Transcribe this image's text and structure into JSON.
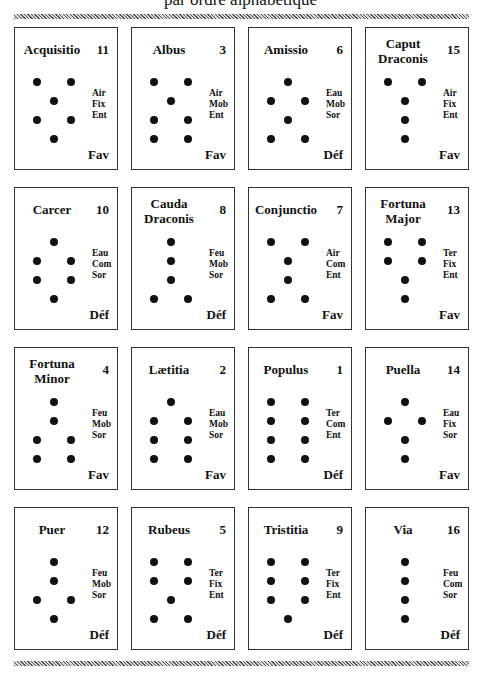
{
  "header": {
    "subtitle": "par ordre alphabétique"
  },
  "figures": [
    {
      "name": "Acquisitio",
      "number": "11",
      "attrs": [
        "Air",
        "Fix",
        "Ent"
      ],
      "status": "Fav",
      "rows": [
        "2",
        "1",
        "2",
        "1"
      ]
    },
    {
      "name": "Albus",
      "number": "3",
      "attrs": [
        "Air",
        "Mob",
        "Ent"
      ],
      "status": "Fav",
      "rows": [
        "2",
        "1",
        "2",
        "2"
      ]
    },
    {
      "name": "Amissio",
      "number": "6",
      "attrs": [
        "Eau",
        "Mob",
        "Sor"
      ],
      "status": "Déf",
      "rows": [
        "1",
        "2",
        "1",
        "2"
      ]
    },
    {
      "name": "Caput Draconis",
      "number": "15",
      "attrs": [
        "Air",
        "Fix",
        "Ent"
      ],
      "status": "Fav",
      "rows": [
        "2",
        "1",
        "1",
        "1"
      ]
    },
    {
      "name": "Carcer",
      "number": "10",
      "attrs": [
        "Eau",
        "Com",
        "Sor"
      ],
      "status": "Déf",
      "rows": [
        "1",
        "2",
        "2",
        "1"
      ]
    },
    {
      "name": "Cauda Draconis",
      "number": "8",
      "attrs": [
        "Feu",
        "Mob",
        "Sor"
      ],
      "status": "Déf",
      "rows": [
        "1",
        "1",
        "1",
        "2"
      ]
    },
    {
      "name": "Conjunctio",
      "number": "7",
      "attrs": [
        "Air",
        "Com",
        "Ent"
      ],
      "status": "Fav",
      "rows": [
        "2",
        "1",
        "1",
        "2"
      ]
    },
    {
      "name": "Fortuna Major",
      "number": "13",
      "attrs": [
        "Ter",
        "Fix",
        "Ent"
      ],
      "status": "Fav",
      "rows": [
        "2",
        "2",
        "1",
        "1"
      ]
    },
    {
      "name": "Fortuna Minor",
      "number": "4",
      "attrs": [
        "Feu",
        "Mob",
        "Sor"
      ],
      "status": "Fav",
      "rows": [
        "1",
        "1",
        "2",
        "2"
      ]
    },
    {
      "name": "Lætitia",
      "number": "2",
      "attrs": [
        "Eau",
        "Mob",
        "Sor"
      ],
      "status": "Fav",
      "rows": [
        "1",
        "2",
        "2",
        "2"
      ]
    },
    {
      "name": "Populus",
      "number": "1",
      "attrs": [
        "Ter",
        "Com",
        "Ent"
      ],
      "status": "Déf",
      "rows": [
        "2",
        "2",
        "2",
        "2"
      ]
    },
    {
      "name": "Puella",
      "number": "14",
      "attrs": [
        "Eau",
        "Fix",
        "Sor"
      ],
      "status": "Fav",
      "rows": [
        "1",
        "2",
        "1",
        "1"
      ]
    },
    {
      "name": "Puer",
      "number": "12",
      "attrs": [
        "Feu",
        "Mob",
        "Sor"
      ],
      "status": "Déf",
      "rows": [
        "1",
        "1",
        "2",
        "1"
      ]
    },
    {
      "name": "Rubeus",
      "number": "5",
      "attrs": [
        "Ter",
        "Fix",
        "Ent"
      ],
      "status": "Déf",
      "rows": [
        "2",
        "2",
        "1",
        "2"
      ]
    },
    {
      "name": "Tristitia",
      "number": "9",
      "attrs": [
        "Ter",
        "Fix",
        "Ent"
      ],
      "status": "Déf",
      "rows": [
        "2",
        "2",
        "2",
        "1"
      ]
    },
    {
      "name": "Via",
      "number": "16",
      "attrs": [
        "Feu",
        "Com",
        "Sor"
      ],
      "status": "Déf",
      "rows": [
        "1",
        "1",
        "1",
        "1"
      ]
    }
  ]
}
